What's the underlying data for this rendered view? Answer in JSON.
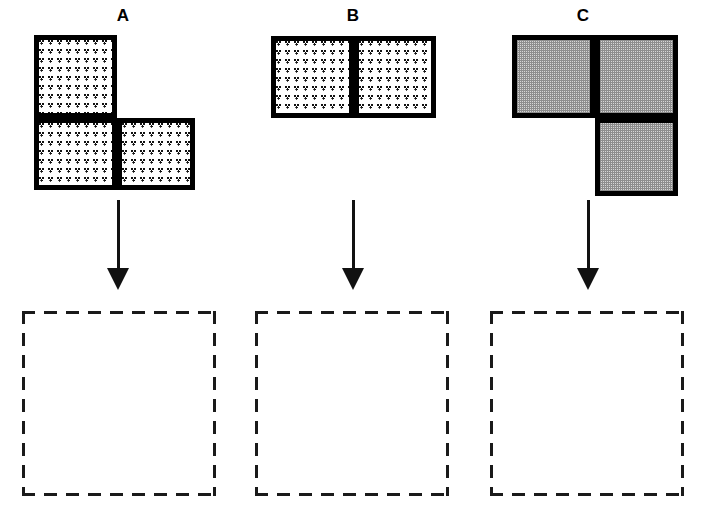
{
  "canvas": {
    "width": 702,
    "height": 521,
    "background": "#ffffff"
  },
  "palette": {
    "outline": "#000000",
    "dot_pattern_ink": "#111111",
    "gray_fill": "#d6d6d6",
    "arrow": "#111111",
    "dashed_outline": "#1a1a1a",
    "page_background": "#ffffff"
  },
  "columns": [
    {
      "id": "a",
      "label": "A",
      "label_x": 103,
      "label_y": 6,
      "shape": {
        "name": "l-tromino-dotted",
        "fill_style": "dotted",
        "square_size": 83,
        "origin_x": 34,
        "origin_y": 35,
        "cells": [
          {
            "name": "cell-top-left",
            "row": 0,
            "col": 0
          },
          {
            "name": "cell-bottom-left",
            "row": 1,
            "col": 0
          },
          {
            "name": "cell-bottom-right",
            "row": 1,
            "col": 1
          }
        ]
      },
      "arrow": {
        "name": "arrow-down-a",
        "x": 118,
        "y_top": 200,
        "y_bottom": 290
      },
      "target": {
        "name": "target-box-a",
        "x": 22,
        "y": 311,
        "width": 194,
        "height": 185,
        "contents": ""
      }
    },
    {
      "id": "b",
      "label": "B",
      "label_x": 333,
      "label_y": 6,
      "shape": {
        "name": "domino-dotted",
        "fill_style": "dotted",
        "square_size": 83,
        "origin_x": 271,
        "origin_y": 36,
        "cells": [
          {
            "name": "cell-left",
            "row": 0,
            "col": 0
          },
          {
            "name": "cell-right",
            "row": 0,
            "col": 1
          }
        ]
      },
      "arrow": {
        "name": "arrow-down-b",
        "x": 353,
        "y_top": 200,
        "y_bottom": 290
      },
      "target": {
        "name": "target-box-b",
        "x": 255,
        "y": 311,
        "width": 194,
        "height": 185,
        "contents": ""
      }
    },
    {
      "id": "c",
      "label": "C",
      "label_x": 563,
      "label_y": 6,
      "shape": {
        "name": "l-tromino-gray",
        "fill_style": "gray",
        "square_size": 83,
        "origin_x": 512,
        "origin_y": 35,
        "cells": [
          {
            "name": "cell-top-left",
            "row": 0,
            "col": 0
          },
          {
            "name": "cell-top-right",
            "row": 0,
            "col": 1
          },
          {
            "name": "cell-bottom-right",
            "row": 1,
            "col": 1
          }
        ]
      },
      "arrow": {
        "name": "arrow-down-c",
        "x": 588,
        "y_top": 200,
        "y_bottom": 290
      },
      "target": {
        "name": "target-box-c",
        "x": 490,
        "y": 311,
        "width": 194,
        "height": 185,
        "contents": ""
      }
    }
  ]
}
